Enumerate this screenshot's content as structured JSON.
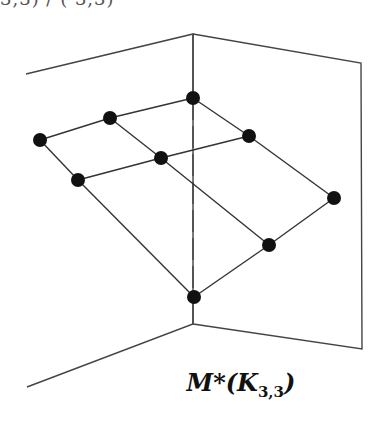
{
  "header_fragment": "3,3) / (   3,3)",
  "caption": {
    "main": "M*(K",
    "subscript": "3,3",
    "close": ")"
  },
  "diagram": {
    "planes": {
      "left": [
        [
          26,
          74
        ],
        [
          193,
          34
        ],
        [
          193,
          324
        ],
        [
          27,
          387
        ]
      ],
      "right": [
        [
          193,
          34
        ],
        [
          361,
          63
        ],
        [
          362,
          349
        ],
        [
          193,
          324
        ]
      ]
    },
    "spine": {
      "top": [
        193,
        34
      ],
      "bottom": [
        193,
        324
      ],
      "style": "dashed-behind-mesh"
    },
    "nodes": [
      {
        "id": "A",
        "x": 40,
        "y": 140
      },
      {
        "id": "B",
        "x": 110,
        "y": 118
      },
      {
        "id": "C",
        "x": 193,
        "y": 98
      },
      {
        "id": "D",
        "x": 78,
        "y": 180
      },
      {
        "id": "E",
        "x": 161,
        "y": 158
      },
      {
        "id": "F",
        "x": 249,
        "y": 136
      },
      {
        "id": "G",
        "x": 334,
        "y": 198
      },
      {
        "id": "H",
        "x": 269,
        "y": 245
      },
      {
        "id": "I",
        "x": 194,
        "y": 297
      }
    ],
    "edges": [
      [
        "A",
        "B"
      ],
      [
        "B",
        "C"
      ],
      [
        "D",
        "E"
      ],
      [
        "E",
        "F"
      ],
      [
        "A",
        "D"
      ],
      [
        "B",
        "E"
      ],
      [
        "C",
        "F"
      ],
      [
        "D",
        "I"
      ],
      [
        "E",
        "H"
      ],
      [
        "F",
        "G"
      ],
      [
        "I",
        "H"
      ],
      [
        "H",
        "G"
      ]
    ],
    "colors": {
      "line": "#333333",
      "node": "#111111",
      "plane": "#444444"
    }
  }
}
